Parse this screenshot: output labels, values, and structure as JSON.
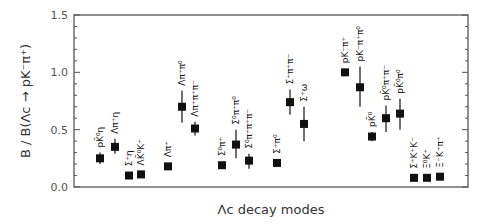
{
  "chart_data": {
    "type": "scatter",
    "title": "",
    "xlabel": "Λc decay modes",
    "ylabel": "B / B(Λc → pK⁻π⁺)",
    "ylim": [
      0.0,
      1.5
    ],
    "yticks": [
      "0.0",
      "0.5",
      "1.0",
      "1.5"
    ],
    "grid": false,
    "legend": null,
    "marker": "filled-square-with-error-bar",
    "categories": [
      "pK̄⁰η",
      "Λπ⁺η",
      "Σ⁺η",
      "ΛK̄⁰K⁺",
      "Λπ⁺",
      "Λπ⁺π⁰",
      "Λπ⁺π⁺π⁻",
      "Σ⁰π⁺",
      "Σ⁰π⁺π⁰",
      "Σ⁰π⁺π⁺π⁻",
      "Σ⁺π⁰",
      "Σ⁺π⁺π⁻",
      "Σ⁺ω",
      "pK⁻π⁺",
      "pK⁻π⁺π⁰",
      "pK̄⁰",
      "pK̄⁰π⁺π⁻",
      "pK̄⁰π⁰",
      "Σ⁺K⁺K⁻",
      "Ξ⁰K⁺",
      "Ξ⁻K⁺π⁺"
    ],
    "points": [
      {
        "label": "pK̄⁰η",
        "x_px": 100,
        "value": 0.25,
        "err_lo": 0.2,
        "err_hi": 0.3
      },
      {
        "label": "Λπ⁺η",
        "x_px": 115,
        "value": 0.35,
        "err_lo": 0.29,
        "err_hi": 0.42
      },
      {
        "label": "Σ⁺η",
        "x_px": 129,
        "value": 0.1,
        "err_lo": 0.07,
        "err_hi": 0.13
      },
      {
        "label": "ΛK̄⁰K⁺",
        "x_px": 141,
        "value": 0.11,
        "err_lo": 0.09,
        "err_hi": 0.13
      },
      {
        "label": "Λπ⁺",
        "x_px": 168,
        "value": 0.18,
        "err_lo": 0.17,
        "err_hi": 0.19
      },
      {
        "label": "Λπ⁺π⁰",
        "x_px": 182,
        "value": 0.7,
        "err_lo": 0.56,
        "err_hi": 0.84
      },
      {
        "label": "Λπ⁺π⁺π⁻",
        "x_px": 195,
        "value": 0.51,
        "err_lo": 0.45,
        "err_hi": 0.57
      },
      {
        "label": "Σ⁰π⁺",
        "x_px": 222,
        "value": 0.19,
        "err_lo": 0.17,
        "err_hi": 0.21
      },
      {
        "label": "Σ⁰π⁺π⁰",
        "x_px": 236,
        "value": 0.37,
        "err_lo": 0.25,
        "err_hi": 0.5
      },
      {
        "label": "Σ⁰π⁺π⁺π⁻",
        "x_px": 249,
        "value": 0.23,
        "err_lo": 0.16,
        "err_hi": 0.29
      },
      {
        "label": "Σ⁺π⁰",
        "x_px": 277,
        "value": 0.21,
        "err_lo": 0.18,
        "err_hi": 0.24
      },
      {
        "label": "Σ⁺π⁺π⁻",
        "x_px": 290,
        "value": 0.74,
        "err_lo": 0.63,
        "err_hi": 0.85
      },
      {
        "label": "Σ⁺ω",
        "x_px": 304,
        "value": 0.55,
        "err_lo": 0.4,
        "err_hi": 0.7
      },
      {
        "label": "pK⁻π⁺",
        "x_px": 345,
        "value": 1.0,
        "err_lo": 1.0,
        "err_hi": 1.0
      },
      {
        "label": "pK⁻π⁺π⁰",
        "x_px": 360,
        "value": 0.87,
        "err_lo": 0.7,
        "err_hi": 1.05
      },
      {
        "label": "pK̄⁰",
        "x_px": 372,
        "value": 0.44,
        "err_lo": 0.4,
        "err_hi": 0.48
      },
      {
        "label": "pK̄⁰π⁺π⁻",
        "x_px": 386,
        "value": 0.6,
        "err_lo": 0.48,
        "err_hi": 0.71
      },
      {
        "label": "pK̄⁰π⁰",
        "x_px": 400,
        "value": 0.64,
        "err_lo": 0.5,
        "err_hi": 0.77
      },
      {
        "label": "Σ⁺K⁺K⁻",
        "x_px": 414,
        "value": 0.08,
        "err_lo": 0.07,
        "err_hi": 0.09
      },
      {
        "label": "Ξ⁰K⁺",
        "x_px": 427,
        "value": 0.08,
        "err_lo": 0.07,
        "err_hi": 0.09
      },
      {
        "label": "Ξ⁻K⁺π⁺",
        "x_px": 440,
        "value": 0.09,
        "err_lo": 0.08,
        "err_hi": 0.1
      }
    ]
  },
  "axis": {
    "y_title": "B / B(Λc → pK⁻π⁺)",
    "x_title": "Λc decay modes"
  },
  "colors": {
    "frame": "#555555",
    "marker": "#111111",
    "text": "#333333"
  }
}
